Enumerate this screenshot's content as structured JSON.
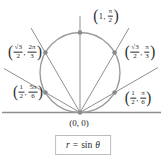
{
  "symbols": {
    "open": "(",
    "close": ")",
    "comma": ","
  },
  "labels": {
    "top": {
      "r": "1",
      "theta_num": "π",
      "theta_den": "2"
    },
    "upper_left": {
      "r_num": "√3",
      "r_den": "2",
      "theta_num": "2π",
      "theta_den": "3"
    },
    "upper_right": {
      "r_num": "√3",
      "r_den": "2",
      "theta_num": "π",
      "theta_den": "3"
    },
    "lower_left": {
      "r_num": "1",
      "r_den": "2",
      "theta_num": "5π",
      "theta_den": "6"
    },
    "lower_right": {
      "r_num": "1",
      "r_den": "2",
      "theta_num": "π",
      "theta_den": "6"
    },
    "origin": "(0, 0)"
  },
  "formula": {
    "lhs": "r",
    "eq": "=",
    "fn": "sin",
    "arg": "θ"
  },
  "points": [
    {
      "r": "1",
      "theta": "π/2"
    },
    {
      "r": "√3/2",
      "theta": "2π/3"
    },
    {
      "r": "√3/2",
      "theta": "π/3"
    },
    {
      "r": "1/2",
      "theta": "5π/6"
    },
    {
      "r": "1/2",
      "theta": "π/6"
    },
    {
      "r": "0",
      "theta": "0"
    }
  ],
  "colors": {
    "curve": "#9c9c9c",
    "line": "#8f8f8f",
    "dot": "#8a8a8a",
    "text": "#2a2a2a",
    "box_border": "#bdbdbd"
  }
}
